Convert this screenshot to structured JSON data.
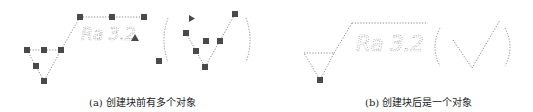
{
  "figure": {
    "panel_a": {
      "caption": "(a) 创建块前有多个对象",
      "symbol_text": "Ra 3.2"
    },
    "panel_b": {
      "caption": "(b) 创建块后是一个对象",
      "symbol_text": "Ra 3.2"
    }
  }
}
